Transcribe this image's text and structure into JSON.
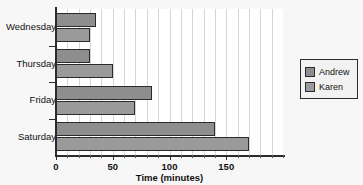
{
  "chart_data": {
    "type": "bar",
    "orientation": "horizontal",
    "title": "",
    "xlabel": "Time (minutes)",
    "ylabel": "",
    "categories": [
      "Wednesday",
      "Thursday",
      "Friday",
      "Saturday"
    ],
    "series": [
      {
        "name": "Andrew",
        "values": [
          35,
          30,
          85,
          140
        ],
        "color": "#8e8e8e"
      },
      {
        "name": "Karen",
        "values": [
          30,
          50,
          70,
          170
        ],
        "color": "#9a9a9a"
      }
    ],
    "xlim": [
      0,
      200
    ],
    "xticks": [
      0,
      50,
      100,
      150
    ],
    "xtick_labels": [
      "0",
      "50",
      "100",
      "150"
    ],
    "minor_tick_step": 10,
    "grid": true,
    "grid_axis": "x",
    "legend_position": "right",
    "legend_entries": [
      "Andrew",
      "Karen"
    ]
  },
  "legend": {
    "items": [
      {
        "label": "Andrew"
      },
      {
        "label": "Karen"
      }
    ]
  },
  "axis": {
    "x_title": "Time (minutes)"
  }
}
